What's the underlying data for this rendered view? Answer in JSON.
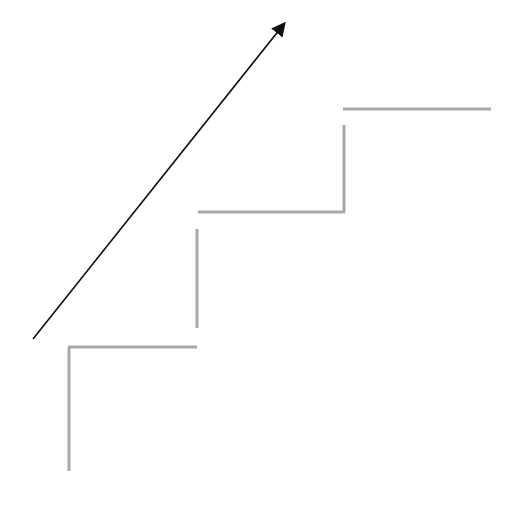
{
  "diagram": {
    "colors": {
      "arrow": "#111111",
      "stairs": "#a9a9a9",
      "background": "#ffffff"
    },
    "arrow": {
      "x1": 33,
      "y1": 339,
      "x2": 287,
      "y2": 20
    },
    "steps": [
      {
        "riser": [
          69,
          471,
          69,
          347
        ],
        "tread": [
          68,
          347,
          197,
          347
        ]
      },
      {
        "riser": [
          197,
          328,
          197,
          229
        ],
        "tread": [
          198,
          212,
          345,
          212
        ]
      },
      {
        "riser": [
          344,
          212,
          344,
          125
        ],
        "tread": [
          343,
          109,
          491,
          109
        ]
      }
    ]
  }
}
